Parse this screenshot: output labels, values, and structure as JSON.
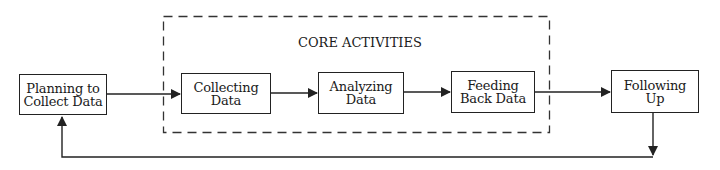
{
  "diagram": {
    "group": {
      "label": "CORE ACTIVITIES",
      "style": "dashed"
    },
    "nodes": [
      {
        "id": "planning",
        "lines": [
          "Planning to",
          "Collect Data"
        ]
      },
      {
        "id": "collecting",
        "lines": [
          "Collecting",
          "Data"
        ]
      },
      {
        "id": "analyzing",
        "lines": [
          "Analyzing",
          "Data"
        ]
      },
      {
        "id": "feeding",
        "lines": [
          "Feeding",
          "Back Data"
        ]
      },
      {
        "id": "following",
        "lines": [
          "Following",
          "Up"
        ]
      }
    ],
    "edges": [
      {
        "from": "planning",
        "to": "collecting"
      },
      {
        "from": "collecting",
        "to": "analyzing"
      },
      {
        "from": "analyzing",
        "to": "feeding"
      },
      {
        "from": "feeding",
        "to": "following"
      },
      {
        "from": "following",
        "to": "planning",
        "type": "feedback-loop"
      }
    ],
    "colors": {
      "line": "#222222",
      "background": "#ffffff"
    }
  }
}
